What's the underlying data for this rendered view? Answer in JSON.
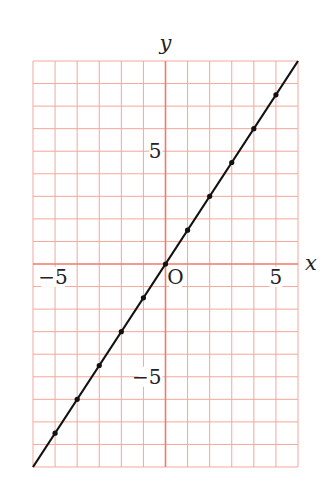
{
  "chart_data": {
    "type": "line",
    "title": "",
    "xlabel": "x",
    "ylabel": "y",
    "origin_label": "O",
    "xlim": [
      -6,
      6
    ],
    "ylim": [
      -9,
      9
    ],
    "grid": true,
    "grid_step": 1,
    "x_ticks_labeled": [
      {
        "value": -5,
        "label": "−5"
      },
      {
        "value": 5,
        "label": "5"
      }
    ],
    "y_ticks_labeled": [
      {
        "value": 5,
        "label": "5"
      },
      {
        "value": -5,
        "label": "−5"
      }
    ],
    "series": [
      {
        "name": "y = 3/2 x",
        "equation": "y = 1.5x",
        "line_from": [
          -6,
          -9
        ],
        "line_to": [
          6,
          9
        ],
        "points": [
          [
            -5,
            -7.5
          ],
          [
            -4,
            -6
          ],
          [
            -3,
            -4.5
          ],
          [
            -2,
            -3
          ],
          [
            -1,
            -1.5
          ],
          [
            0,
            0
          ],
          [
            1,
            1.5
          ],
          [
            2,
            3
          ],
          [
            3,
            4.5
          ],
          [
            4,
            6
          ],
          [
            5,
            7.5
          ]
        ]
      }
    ],
    "colors": {
      "grid": "#f4a79c",
      "axis": "#ee7b6c",
      "line": "#111111",
      "background": "#ffffff"
    }
  }
}
